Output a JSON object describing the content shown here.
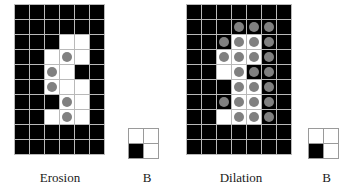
{
  "figure": {
    "background_color": "#ffffff",
    "cell_colors": {
      "foreground_white": "#ffffff",
      "background_black": "#000000",
      "marker_gray": "#808080",
      "grid_line": "#b9b9b9"
    }
  },
  "panels": {
    "erosion": {
      "caption": "Erosion",
      "grid": {
        "columns": 6,
        "rows": 10,
        "legend": {
          "0": "black background cell",
          "1": "white foreground cell",
          "2": "white cell with gray circle marker"
        },
        "cells": [
          [
            0,
            0,
            0,
            0,
            0,
            0
          ],
          [
            0,
            0,
            0,
            0,
            0,
            0
          ],
          [
            0,
            0,
            0,
            1,
            1,
            0
          ],
          [
            0,
            0,
            1,
            2,
            1,
            0
          ],
          [
            0,
            0,
            2,
            1,
            0,
            0
          ],
          [
            0,
            0,
            2,
            1,
            1,
            0
          ],
          [
            0,
            0,
            0,
            2,
            1,
            0
          ],
          [
            0,
            0,
            1,
            2,
            1,
            0
          ],
          [
            0,
            0,
            0,
            0,
            0,
            0
          ],
          [
            0,
            0,
            0,
            0,
            0,
            0
          ]
        ]
      }
    },
    "dilation": {
      "caption": "Dilation",
      "grid": {
        "columns": 7,
        "rows": 10,
        "legend": {
          "0": "black background cell",
          "1": "white foreground cell",
          "2": "white cell with gray circle marker",
          "3": "black cell with gray circle marker"
        },
        "cells": [
          [
            0,
            0,
            0,
            0,
            0,
            0,
            0
          ],
          [
            0,
            0,
            0,
            3,
            3,
            3,
            0
          ],
          [
            0,
            0,
            3,
            2,
            2,
            3,
            0
          ],
          [
            0,
            0,
            2,
            2,
            2,
            3,
            0
          ],
          [
            0,
            0,
            1,
            2,
            3,
            3,
            0
          ],
          [
            0,
            0,
            0,
            2,
            2,
            3,
            0
          ],
          [
            0,
            0,
            3,
            2,
            2,
            3,
            0
          ],
          [
            0,
            0,
            1,
            2,
            2,
            3,
            0
          ],
          [
            0,
            0,
            0,
            0,
            0,
            0,
            0
          ],
          [
            0,
            0,
            0,
            0,
            0,
            0,
            0
          ]
        ]
      }
    },
    "structuring_element_left": {
      "caption": "B",
      "grid": {
        "columns": 2,
        "rows": 2,
        "cells": [
          [
            1,
            1
          ],
          [
            0,
            1
          ]
        ]
      }
    },
    "structuring_element_right": {
      "caption": "B",
      "grid": {
        "columns": 2,
        "rows": 2,
        "cells": [
          [
            1,
            1
          ],
          [
            0,
            1
          ]
        ]
      }
    }
  }
}
